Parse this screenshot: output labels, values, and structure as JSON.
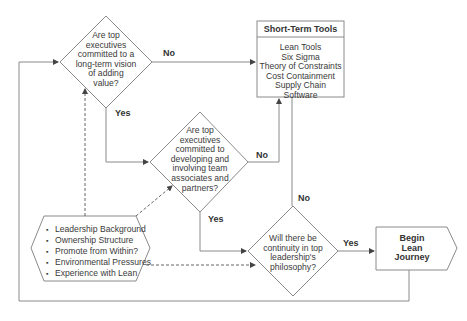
{
  "decisions": [
    {
      "id": "q1",
      "lines": [
        "Are top",
        "executives",
        "committed to a",
        "long-term vision",
        "of adding",
        "value?"
      ],
      "no_label": "No",
      "yes_label": "Yes"
    },
    {
      "id": "q2",
      "lines": [
        "Are top",
        "executives",
        "committed to",
        "developing and",
        "involving  team",
        "associates and",
        "partners?"
      ],
      "no_label": "No",
      "yes_label": "Yes"
    },
    {
      "id": "q3",
      "lines": [
        "Will there be",
        "continuity in top",
        "leadership's",
        "philosophy?"
      ],
      "no_label": "No",
      "yes_label": "Yes"
    }
  ],
  "short_term_tools": {
    "title": "Short-Term Tools",
    "items": [
      "Lean Tools",
      "Six Sigma",
      "Theory of Constraints",
      "Cost Containment",
      "Supply Chain Software"
    ]
  },
  "factors": {
    "items": [
      "Leadership Background",
      "Ownership Structure",
      "Promote from Within?",
      "Environmental Pressures",
      "Experience with Lean"
    ]
  },
  "end": {
    "lines": [
      "Begin",
      "Lean",
      "Journey"
    ]
  },
  "colors": {
    "line": "#8a8a8a",
    "text": "#3a3a3a"
  }
}
